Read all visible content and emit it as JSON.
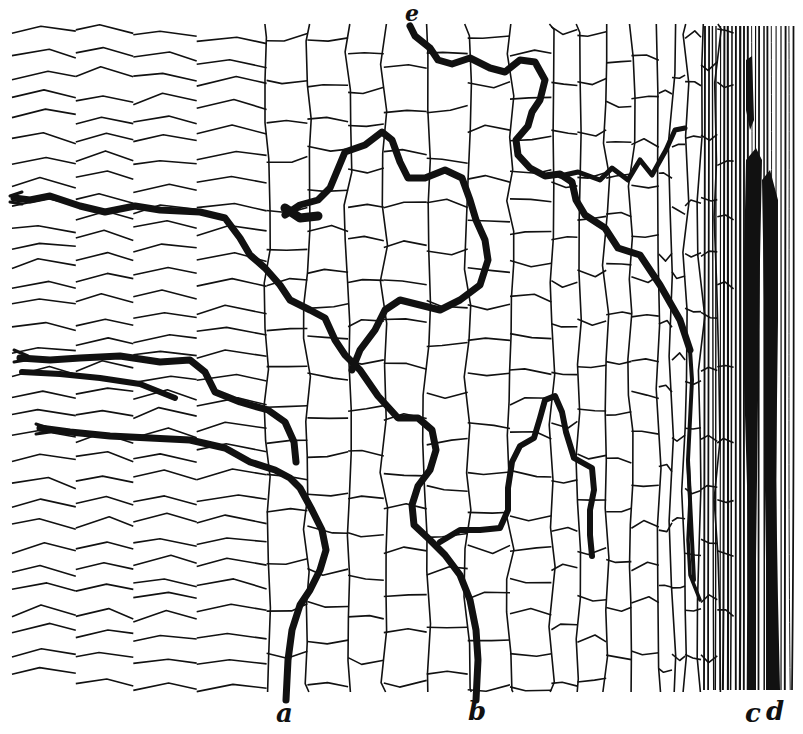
{
  "figure": {
    "type": "histology line drawing",
    "ink_color": "#111111",
    "paper_color": "#ffffff",
    "labels": {
      "a": "a",
      "b": "b",
      "c": "c",
      "d": "d",
      "e": "e"
    },
    "caption_visible": "truncated (unreadable, cut off at bottom edge)"
  }
}
